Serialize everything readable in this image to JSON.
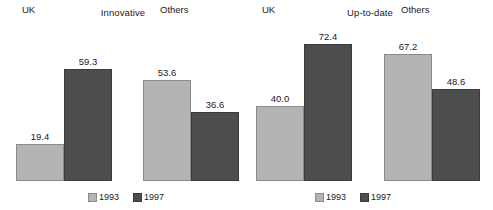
{
  "chart_data": [
    {
      "type": "bar",
      "title": "Innovative",
      "xlabel": "",
      "ylabel": "",
      "ylim": [
        0,
        80
      ],
      "grid": false,
      "legend_position": "bottom-center",
      "categories": [
        "UK",
        "Others"
      ],
      "series": [
        {
          "name": "1993",
          "color": "#b4b4b4",
          "values": [
            19.4,
            53.6
          ]
        },
        {
          "name": "1997",
          "color": "#4d4d4d",
          "values": [
            59.3,
            36.6
          ]
        }
      ],
      "data_labels": [
        "19.4",
        "59.3",
        "53.6",
        "36.6"
      ]
    },
    {
      "type": "bar",
      "title": "Up-to-date",
      "xlabel": "",
      "ylabel": "",
      "ylim": [
        0,
        80
      ],
      "grid": false,
      "legend_position": "bottom-center",
      "categories": [
        "UK",
        "Others"
      ],
      "series": [
        {
          "name": "1993",
          "color": "#b4b4b4",
          "values": [
            40.0,
            67.2
          ]
        },
        {
          "name": "1997",
          "color": "#4d4d4d",
          "values": [
            72.4,
            48.6
          ]
        }
      ],
      "data_labels": [
        "40.0",
        "72.4",
        "67.2",
        "48.6"
      ]
    }
  ],
  "panels": [
    {
      "title": "Innovative",
      "groups": [
        {
          "label": "UK",
          "bars": [
            {
              "series": "1993",
              "value": 19.4,
              "label": "19.4"
            },
            {
              "series": "1997",
              "value": 59.3,
              "label": "59.3"
            }
          ]
        },
        {
          "label": "Others",
          "bars": [
            {
              "series": "1993",
              "value": 53.6,
              "label": "53.6"
            },
            {
              "series": "1997",
              "value": 36.6,
              "label": "36.6"
            }
          ]
        }
      ],
      "legend": [
        {
          "label": "1993",
          "color": "#b4b4b4"
        },
        {
          "label": "1997",
          "color": "#4d4d4d"
        }
      ]
    },
    {
      "title": "Up-to-date",
      "groups": [
        {
          "label": "UK",
          "bars": [
            {
              "series": "1993",
              "value": 40.0,
              "label": "40.0"
            },
            {
              "series": "1997",
              "value": 72.4,
              "label": "72.4"
            }
          ]
        },
        {
          "label": "Others",
          "bars": [
            {
              "series": "1993",
              "value": 67.2,
              "label": "67.2"
            },
            {
              "series": "1997",
              "value": 48.6,
              "label": "48.6"
            }
          ]
        }
      ],
      "legend": [
        {
          "label": "1993",
          "color": "#b4b4b4"
        },
        {
          "label": "1997",
          "color": "#4d4d4d"
        }
      ]
    }
  ],
  "colors": {
    "series_1993": "#b4b4b4",
    "series_1997": "#4d4d4d",
    "bar_outline": "#6f6f6f",
    "background": "#ffffff",
    "text": "#1a1a1a"
  },
  "scale": {
    "value_max": 80,
    "pixels_at_max": 151
  }
}
